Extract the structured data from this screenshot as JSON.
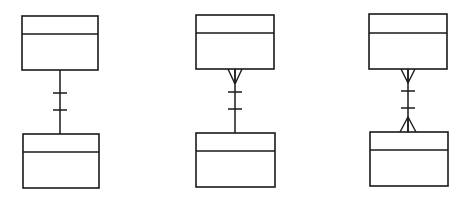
{
  "diagram": {
    "type": "er-cardinality-notation",
    "stroke_color": "#1a1a1a",
    "background": "#ffffff",
    "relationships": [
      {
        "id": "one-to-one",
        "label": "",
        "top_end": "one",
        "bottom_end": "one",
        "top_entity": {
          "x": 22,
          "y": 16,
          "w": 76,
          "h": 54,
          "header_h": 18
        },
        "bottom_entity": {
          "x": 23,
          "y": 134,
          "w": 76,
          "h": 54,
          "header_h": 18
        },
        "line_x": 60,
        "ticks_y": [
          93,
          110
        ],
        "tick_half": 7
      },
      {
        "id": "many-to-one",
        "label": "",
        "top_end": "many",
        "bottom_end": "one",
        "top_entity": {
          "x": 196,
          "y": 15,
          "w": 78,
          "h": 54,
          "header_h": 18
        },
        "bottom_entity": {
          "x": 196,
          "y": 133,
          "w": 79,
          "h": 54,
          "header_h": 18
        },
        "line_x": 235,
        "ticks_y": [
          92,
          109
        ],
        "tick_half": 7,
        "top_crowfoot": {
          "apex_y": 84,
          "spread": 7
        }
      },
      {
        "id": "many-to-many",
        "label": "",
        "top_end": "many",
        "bottom_end": "many",
        "top_entity": {
          "x": 369,
          "y": 14,
          "w": 78,
          "h": 55,
          "header_h": 19
        },
        "bottom_entity": {
          "x": 370,
          "y": 132,
          "w": 78,
          "h": 54,
          "header_h": 18
        },
        "line_x": 408,
        "ticks_y": [
          91,
          108
        ],
        "tick_half": 7,
        "top_crowfoot": {
          "apex_y": 83,
          "spread": 7
        },
        "bottom_crowfoot": {
          "apex_y": 117,
          "spread": 8
        }
      }
    ]
  }
}
